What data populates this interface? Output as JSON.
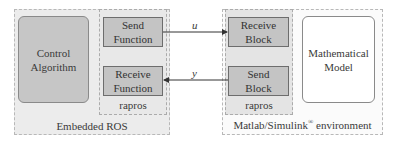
{
  "left_group": {
    "title": "Embedded ROS",
    "control_block": "Control\nAlgorithm",
    "control_line1": "Control",
    "control_line2": "Algorithm",
    "rapros": {
      "label": "rapros",
      "send": {
        "line1": "Send",
        "line2": "Function"
      },
      "receive": {
        "line1": "Receive",
        "line2": "Function"
      }
    }
  },
  "right_group": {
    "title": "Matlab/Simulink",
    "title_sup": "®",
    "title_suffix": " environment",
    "rapros": {
      "label": "rapros",
      "receive": {
        "line1": "Receive",
        "line2": "Block"
      },
      "send": {
        "line1": "Send",
        "line2": "Block"
      }
    },
    "model": {
      "line1": "Mathematical",
      "line2": "Model"
    }
  },
  "signals": {
    "u": "u",
    "y": "y"
  },
  "colors": {
    "block_fill": "#c4c4c4",
    "group_fill": "#ececec",
    "dashed_border": "#b8b8b8",
    "arrow": "#333333"
  }
}
